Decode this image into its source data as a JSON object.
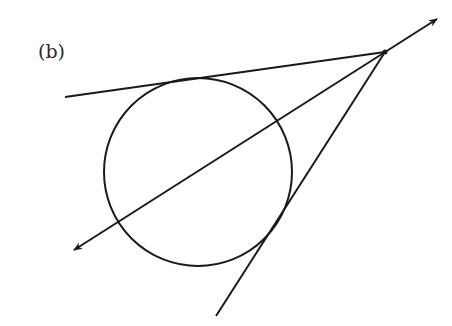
{
  "figure": {
    "label": "(b)",
    "colors": {
      "stroke": "#1a1a1a",
      "background": "#ffffff"
    },
    "circle": {
      "cx": 198,
      "cy": 172,
      "r": 94
    },
    "external_point": {
      "x": 385,
      "y": 52
    },
    "tangent_upper": {
      "x1": 65,
      "y1": 97,
      "x2": 385,
      "y2": 52
    },
    "tangent_lower": {
      "x1": 216,
      "y1": 316,
      "x2": 385,
      "y2": 52
    },
    "secant": {
      "x1": 74,
      "y1": 250,
      "x2": 437,
      "y2": 19,
      "arrows": "both"
    }
  }
}
